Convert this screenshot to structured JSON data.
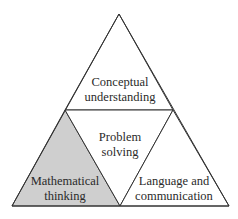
{
  "diagram": {
    "type": "triangle-of-triangles",
    "colors": {
      "background": "#ffffff",
      "stroke": "#333333",
      "highlight_fill": "#cfcfcf",
      "text": "#2a2a2a"
    },
    "regions": {
      "top": {
        "line1": "Conceptual",
        "line2": "understanding",
        "highlighted": false
      },
      "center": {
        "line1": "Problem",
        "line2": "solving",
        "highlighted": false
      },
      "bottom_left": {
        "line1": "Mathematical",
        "line2": "thinking",
        "highlighted": true
      },
      "bottom_right": {
        "line1": "Language and",
        "line2": "communication",
        "highlighted": false
      }
    }
  }
}
